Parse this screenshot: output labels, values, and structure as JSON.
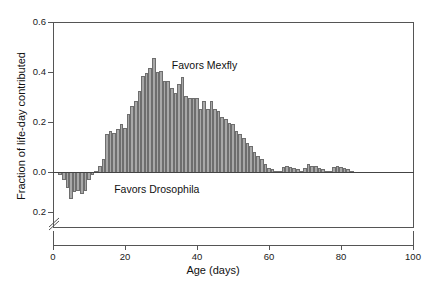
{
  "chart_data": {
    "type": "bar",
    "title": "",
    "subtitle": "",
    "xlabel": "Age (days)",
    "ylabel": "Fraction of life-day contributed",
    "xlim": [
      0,
      100
    ],
    "ylim": [
      -0.2,
      0.6
    ],
    "xticks": [
      0,
      20,
      40,
      60,
      80,
      100
    ],
    "xticklabels": [
      "0",
      "20",
      "40",
      "60",
      "80",
      "100"
    ],
    "yticks": [
      0.6,
      0.4,
      0.2,
      0.0,
      -0.2
    ],
    "yticklabels": [
      "0.6",
      "0.4",
      "0.2",
      "0.0",
      "0.2"
    ],
    "grid": false,
    "legend": false,
    "axis_break": true,
    "axis_break_axis": "y",
    "zero_line": true,
    "bar_color": "#a8a8a8",
    "bar_edge_color": "#6e6e6e",
    "bar_width_days": 1,
    "annotations": [
      {
        "text": "Favors Mexfly",
        "x": 33,
        "y": 0.43
      },
      {
        "text": "Favors Drosophila",
        "x": 17,
        "y": -0.045
      }
    ],
    "x": [
      1,
      2,
      3,
      4,
      5,
      6,
      7,
      8,
      9,
      10,
      11,
      12,
      13,
      14,
      15,
      16,
      17,
      18,
      19,
      20,
      21,
      22,
      23,
      24,
      25,
      26,
      27,
      28,
      29,
      30,
      31,
      32,
      33,
      34,
      35,
      36,
      37,
      38,
      39,
      40,
      41,
      42,
      43,
      44,
      45,
      46,
      47,
      48,
      49,
      50,
      51,
      52,
      53,
      54,
      55,
      56,
      57,
      58,
      59,
      60,
      61,
      62,
      63,
      64,
      65,
      66,
      67,
      68,
      69,
      70,
      71,
      72,
      73,
      74,
      75,
      76,
      77,
      78,
      79,
      80,
      81,
      82,
      83,
      84
    ],
    "values": [
      0.0,
      -0.01,
      -0.035,
      -0.075,
      -0.13,
      -0.095,
      -0.09,
      -0.105,
      -0.09,
      -0.035,
      -0.01,
      0.01,
      0.03,
      0.055,
      0.155,
      0.17,
      0.16,
      0.175,
      0.195,
      0.18,
      0.235,
      0.27,
      0.29,
      0.33,
      0.39,
      0.4,
      0.42,
      0.46,
      0.405,
      0.41,
      0.37,
      0.37,
      0.34,
      0.32,
      0.355,
      0.385,
      0.31,
      0.3,
      0.3,
      0.3,
      0.255,
      0.29,
      0.255,
      0.29,
      0.255,
      0.25,
      0.225,
      0.215,
      0.2,
      0.195,
      0.17,
      0.155,
      0.14,
      0.12,
      0.11,
      0.085,
      0.07,
      0.055,
      0.035,
      0.02,
      0.015,
      0.01,
      0.01,
      0.025,
      0.03,
      0.025,
      0.02,
      0.015,
      0.01,
      0.02,
      0.035,
      0.03,
      0.03,
      0.02,
      0.015,
      0.01,
      0.01,
      0.025,
      0.03,
      0.025,
      0.02,
      0.015,
      0.01,
      0.005
    ]
  },
  "axis_titles": {
    "x": "Age (days)",
    "y": "Fraction of life-day contributed"
  },
  "annotations": {
    "mexfly": "Favors Mexfly",
    "drosophila": "Favors Drosophila"
  }
}
